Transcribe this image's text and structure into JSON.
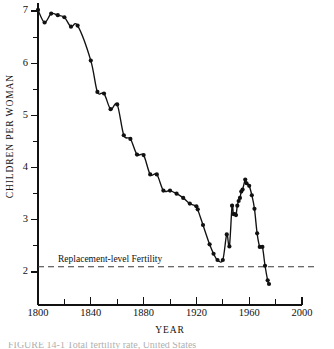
{
  "figure": {
    "caption_fragment": "FIGURE 14-1  Total fertility rate, United States"
  },
  "chart_data": {
    "type": "line",
    "title": "",
    "xlabel": "YEAR",
    "ylabel": "CHILDREN PER WOMAN",
    "xlim": [
      1800,
      2000
    ],
    "ylim": [
      1.5,
      7.15
    ],
    "grid": false,
    "legend": "none",
    "x_major_ticks": [
      1800,
      1840,
      1880,
      1920,
      1960,
      2000
    ],
    "x_major_tick_labels": [
      "1800",
      "1840",
      "1880",
      "1920",
      "1960",
      "2000"
    ],
    "x_minor_ticks": [
      1820,
      1860,
      1900,
      1940,
      1980
    ],
    "y_major_ticks": [
      2,
      3,
      4,
      5,
      6,
      7
    ],
    "y_major_tick_labels": [
      "2",
      "3",
      "4",
      "5",
      "6",
      "7"
    ],
    "y_minor_ticks": [
      2.5,
      3.5,
      4.5,
      5.5,
      6.5
    ],
    "annotations": [
      {
        "name": "replacement-level-fertility",
        "text": "Replacement-level Fertility",
        "value": 2.1,
        "style": "dashed-horizontal-line"
      }
    ],
    "series": [
      {
        "name": "Total fertility rate",
        "marker": "filled-circle",
        "line": "smooth-solid",
        "x": [
          1800,
          1805,
          1810,
          1815,
          1820,
          1825,
          1830,
          1840,
          1845,
          1850,
          1855,
          1860,
          1865,
          1870,
          1875,
          1880,
          1885,
          1890,
          1895,
          1900,
          1905,
          1910,
          1915,
          1920,
          1921,
          1925,
          1930,
          1933,
          1936,
          1940,
          1943,
          1945,
          1947,
          1948,
          1949,
          1950,
          1951,
          1952,
          1953,
          1954,
          1955,
          1957,
          1958,
          1960,
          1962,
          1964,
          1966,
          1968,
          1970,
          1972,
          1974,
          1975
        ],
        "y": [
          7.02,
          6.78,
          6.95,
          6.92,
          6.88,
          6.7,
          6.72,
          6.05,
          5.45,
          5.42,
          5.12,
          5.21,
          4.62,
          4.55,
          4.25,
          4.24,
          3.87,
          3.87,
          3.56,
          3.56,
          3.5,
          3.42,
          3.31,
          3.26,
          3.2,
          2.9,
          2.53,
          2.35,
          2.23,
          2.23,
          2.72,
          2.49,
          3.27,
          3.11,
          3.11,
          3.09,
          3.27,
          3.36,
          3.42,
          3.54,
          3.58,
          3.77,
          3.7,
          3.65,
          3.47,
          3.21,
          2.74,
          2.48,
          2.48,
          2.12,
          1.84,
          1.77
        ]
      }
    ]
  },
  "axes": {
    "y_title": "CHILDREN PER WOMAN",
    "x_title": "YEAR"
  }
}
